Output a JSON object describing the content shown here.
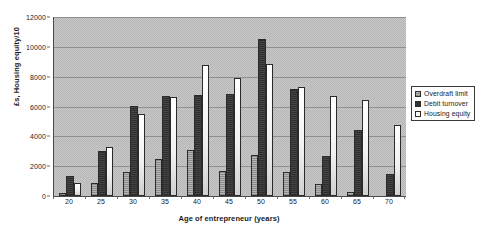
{
  "chart_data": {
    "type": "bar",
    "title": "",
    "xlabel": "Age of entrepreneur (years)",
    "ylabel": "£s, Housing equity/10",
    "categories": [
      "20",
      "25",
      "30",
      "35",
      "40",
      "45",
      "50",
      "55",
      "60",
      "65",
      "70"
    ],
    "series": [
      {
        "name": "Overdraft limit",
        "color": "#9a9a9a",
        "values": [
          200,
          900,
          1600,
          2450,
          3100,
          1700,
          2750,
          1600,
          800,
          300,
          0
        ]
      },
      {
        "name": "Debit turnover",
        "color": "#333333",
        "values": [
          1350,
          3050,
          6050,
          6700,
          6800,
          6850,
          10550,
          7150,
          2700,
          4400,
          1500
        ]
      },
      {
        "name": "Housing equity",
        "color": "#ffffff",
        "values": [
          850,
          3300,
          5500,
          6650,
          8750,
          7900,
          8850,
          7300,
          6700,
          6450,
          4750
        ]
      }
    ],
    "ylim": [
      0,
      12000
    ],
    "yticks": [
      "0",
      "2000",
      "4000",
      "6000",
      "8000",
      "10000",
      "12000"
    ],
    "ytick_values": [
      0,
      2000,
      4000,
      6000,
      8000,
      10000,
      12000
    ],
    "grid": true,
    "legend_position": "right",
    "plot_background": "#bfbfbf",
    "figure_background": "#ffffff"
  }
}
